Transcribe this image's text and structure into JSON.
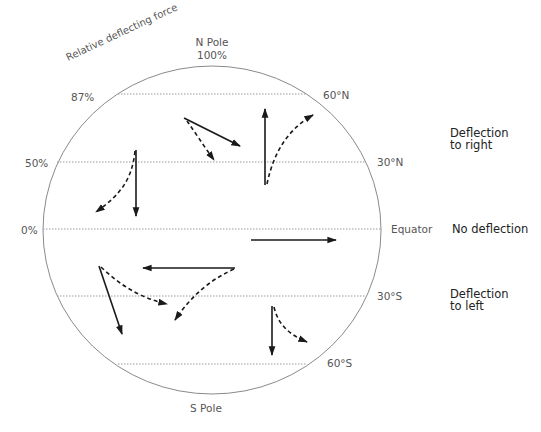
{
  "title": "Relative deflecting force",
  "poles": {
    "north": "N Pole",
    "north_force": "100%",
    "south": "S Pole"
  },
  "force_labels": [
    {
      "id": "f87",
      "text": "87%"
    },
    {
      "id": "f50",
      "text": "50%"
    },
    {
      "id": "f0",
      "text": "0%"
    }
  ],
  "latitude_labels": [
    {
      "id": "lat60n",
      "text": "60°N"
    },
    {
      "id": "lat30n",
      "text": "30°N"
    },
    {
      "id": "equator",
      "text": "Equator"
    },
    {
      "id": "lat30s",
      "text": "30°S"
    },
    {
      "id": "lat60s",
      "text": "60°S"
    }
  ],
  "deflection_labels": {
    "north_line1": "Deflection",
    "north_line2": "to right",
    "equator": "No deflection",
    "south_line1": "Deflection",
    "south_line2": "to left"
  },
  "colors": {
    "globe_outline": "#8a8a8a",
    "gridline": "#9a9a9a",
    "arrow": "#1a1a1a",
    "label": "#555555",
    "side_label": "#222222"
  },
  "legend": {
    "solid_arrow": "intended path",
    "dashed_arrow": "deflected path"
  }
}
